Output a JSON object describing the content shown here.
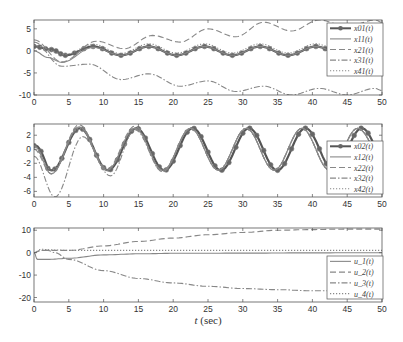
{
  "chart_data": [
    {
      "type": "line",
      "panel": "top",
      "title": "",
      "xlabel": "",
      "ylabel": "",
      "xlim": [
        0,
        50
      ],
      "ylim": [
        -10,
        7
      ],
      "xticks": [
        "0",
        "5",
        "10",
        "15",
        "20",
        "25",
        "30",
        "35",
        "40",
        "45",
        "50"
      ],
      "yticks": [
        "5",
        "0",
        "-5",
        "-10"
      ],
      "grid": false,
      "legend_position": "upper right",
      "legend": [
        "x_0^1(t)",
        "x_1^1(t)",
        "x_2^1(t)",
        "x_3^1(t)",
        "x_4^1(t)"
      ],
      "series": [
        {
          "name": "x_0^1(t)",
          "style": "solid-marker",
          "x": [
            0,
            2.5,
            4.5,
            8.5,
            12.5,
            16.5,
            20.5,
            24.5,
            28.5,
            32.5,
            36.5,
            40.5,
            44.5,
            48.5,
            50
          ],
          "values": [
            1,
            0.3,
            -1,
            1,
            -1,
            1,
            -1,
            1,
            -1,
            1,
            -1,
            1,
            -1,
            1,
            0.8
          ]
        },
        {
          "name": "x_1^1(t)",
          "style": "solid",
          "x": [
            0,
            2,
            4,
            8.5,
            12.5,
            16.5,
            20.5,
            24.5,
            28.5,
            32.5,
            36.5,
            40.5,
            44.5,
            48.5,
            50
          ],
          "values": [
            0,
            -1.5,
            -2.6,
            0.8,
            -1,
            1,
            -1,
            1,
            -1,
            1,
            -1,
            1,
            -1,
            1,
            0.8
          ]
        },
        {
          "name": "x_2^1(t)",
          "style": "dashed",
          "x": [
            0,
            4,
            9,
            13,
            17,
            21,
            25,
            29,
            33,
            37,
            41,
            45,
            49,
            50
          ],
          "values": [
            2.5,
            -2.5,
            2.2,
            0.5,
            3.5,
            2,
            5,
            3.2,
            6.5,
            4.5,
            7,
            5.5,
            7,
            6.5
          ]
        },
        {
          "name": "x_3^1(t)",
          "style": "dashdot",
          "x": [
            0,
            4,
            8,
            12.5,
            16.5,
            21,
            25,
            29,
            33,
            37,
            41,
            45,
            49,
            50
          ],
          "values": [
            2,
            -3.5,
            -3,
            -6.5,
            -5.2,
            -8,
            -6.8,
            -9.2,
            -8,
            -10,
            -8.5,
            -10,
            -8.5,
            -9
          ]
        },
        {
          "name": "x_4^1(t)",
          "style": "dotted",
          "x": [
            0,
            4.5,
            8.5,
            12.5,
            16.5,
            20.5,
            24.5,
            28.5,
            32.5,
            36.5,
            40.5,
            44.5,
            48.5,
            50
          ],
          "values": [
            1.2,
            -0.8,
            1.5,
            -0.6,
            1.6,
            -0.5,
            1.6,
            -0.5,
            1.6,
            -0.5,
            1.6,
            -0.5,
            1.6,
            1.2
          ]
        }
      ]
    },
    {
      "type": "line",
      "panel": "middle",
      "title": "",
      "xlabel": "",
      "ylabel": "",
      "xlim": [
        0,
        50
      ],
      "ylim": [
        -6.8,
        3.6
      ],
      "xticks": [
        "0",
        "5",
        "10",
        "15",
        "20",
        "25",
        "30",
        "35",
        "40",
        "45",
        "50"
      ],
      "yticks": [
        "2",
        "0",
        "-2",
        "-4",
        "-6"
      ],
      "grid": false,
      "legend_position": "lower right",
      "legend": [
        "x_0^2(t)",
        "x_1^2(t)",
        "x_2^2(t)",
        "x_3^2(t)",
        "x_4^2(t)"
      ],
      "series": [
        {
          "name": "x_0^2(t)",
          "style": "solid-marker",
          "period": 8.1,
          "amplitude": 3,
          "phase_peak_t": 6.6,
          "start": 0.5
        },
        {
          "name": "x_1^2(t)",
          "style": "solid",
          "x": [
            0,
            2.5,
            6.5,
            10.5,
            14.5,
            18.5,
            22.5,
            26.5,
            30.5,
            34.5,
            38.5,
            42.5,
            46.5,
            50
          ],
          "values": [
            0.5,
            -3.5,
            3.2,
            -3,
            3,
            -3,
            3,
            -3,
            3,
            -3,
            3,
            -3,
            3,
            -1
          ]
        },
        {
          "name": "x_2^2(t)",
          "style": "dashed",
          "x": [
            0,
            2.5,
            6.5,
            10.5,
            14.5,
            18.5,
            22.5,
            26.5,
            30.5,
            34.5,
            38.5,
            42.5,
            46.5,
            50
          ],
          "values": [
            0,
            -3.5,
            3.5,
            -2.8,
            3.3,
            -3.2,
            3,
            -3,
            3,
            -3,
            3,
            -3,
            3,
            -1
          ]
        },
        {
          "name": "x_3^2(t)",
          "style": "dashdot",
          "x": [
            0,
            3,
            7,
            11,
            14.5,
            18.5,
            22.5,
            26.5,
            30.5,
            34.5,
            38.5,
            42.5,
            46.5,
            50
          ],
          "values": [
            -1,
            -6.8,
            1.8,
            -3.8,
            2.8,
            -3.2,
            3,
            -3,
            3,
            -3,
            3,
            -3,
            3,
            -1
          ]
        },
        {
          "name": "x_4^2(t)",
          "style": "dotted",
          "x": [
            0,
            2.5,
            6.5,
            10.5,
            14.5,
            18.5,
            22.5,
            26.5,
            30.5,
            34.5,
            38.5,
            42.5,
            46.5,
            50
          ],
          "values": [
            0.5,
            -3,
            3,
            -3,
            3,
            -3,
            3,
            -3,
            3,
            -3,
            3,
            -3,
            3,
            -1
          ]
        }
      ]
    },
    {
      "type": "line",
      "panel": "bottom",
      "title": "",
      "xlabel": "t (sec)",
      "ylabel": "",
      "xlim": [
        0,
        50
      ],
      "ylim": [
        -22,
        11
      ],
      "xticks": [
        "0",
        "5",
        "10",
        "15",
        "20",
        "25",
        "30",
        "35",
        "40",
        "45",
        "50"
      ],
      "yticks": [
        "10",
        "0",
        "-10",
        "-20"
      ],
      "grid": false,
      "legend_position": "lower right",
      "legend": [
        "u_1(t)",
        "u_2(t)",
        "u_3(t)",
        "u_4(t)"
      ],
      "series": [
        {
          "name": "u_1(t)",
          "x": [
            0,
            0.5,
            2,
            5,
            10,
            15,
            20,
            30,
            40,
            50
          ],
          "values": [
            0,
            -3,
            -3,
            -2.5,
            -1,
            -0.5,
            -0.3,
            -0.2,
            -0.1,
            0
          ],
          "style": "solid"
        },
        {
          "name": "u_2(t)",
          "x": [
            0,
            1,
            5,
            10,
            15,
            20,
            25,
            30,
            35,
            40,
            45,
            50
          ],
          "values": [
            0,
            1,
            1,
            3,
            5,
            6.5,
            8,
            9,
            10,
            10.3,
            10.5,
            10.5
          ],
          "style": "dashed"
        },
        {
          "name": "u_3(t)",
          "x": [
            0,
            1,
            2,
            3,
            5,
            10,
            15,
            20,
            25,
            30,
            35,
            40,
            45,
            50
          ],
          "values": [
            0,
            1,
            1,
            0,
            -3,
            -8,
            -11.5,
            -13.5,
            -15,
            -16,
            -16.5,
            -17,
            -17,
            -17
          ],
          "style": "dashdot"
        },
        {
          "name": "u_4(t)",
          "x": [
            0,
            1,
            3,
            5,
            10,
            20,
            30,
            40,
            50
          ],
          "values": [
            0,
            1.5,
            1.2,
            1,
            1,
            1,
            1,
            1,
            1
          ],
          "style": "dotted"
        }
      ]
    }
  ],
  "panels": {
    "top": {
      "yticks": [
        "5",
        "0",
        "-5",
        "-10"
      ],
      "legend": [
        "x_0^1(t)",
        "x_1^1(t)",
        "x_2^1(t)",
        "x_3^1(t)",
        "x_4^1(t)"
      ]
    },
    "middle": {
      "yticks": [
        "2",
        "0",
        "-2",
        "-4",
        "-6"
      ],
      "legend": [
        "x_0^2(t)",
        "x_1^2(t)",
        "x_2^2(t)",
        "x_3^2(t)",
        "x_4^2(t)"
      ]
    },
    "bottom": {
      "yticks": [
        "10",
        "0",
        "-10",
        "-20"
      ],
      "legend": [
        "u_1(t)",
        "u_2(t)",
        "u_3(t)",
        "u_4(t)"
      ]
    }
  },
  "xticks": [
    "0",
    "5",
    "10",
    "15",
    "20",
    "25",
    "30",
    "35",
    "40",
    "45",
    "50"
  ],
  "xlabel": {
    "t": "t",
    "unit": "(sec)"
  },
  "colors": {
    "line": "#555555",
    "marker": "#666666",
    "axis": "#555555",
    "text": "#333333"
  }
}
